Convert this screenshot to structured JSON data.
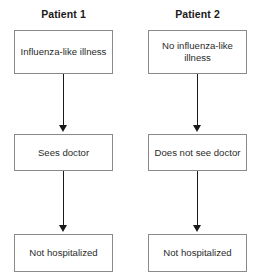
{
  "diagram": {
    "background_color": "#ffffff",
    "box_border_color": "#8a8a8a",
    "arrow_color": "#1a1a1a",
    "text_color": "#2b2b2b",
    "header_text_color": "#1a1a1a",
    "columns": [
      {
        "header": "Patient 1",
        "nodes": [
          {
            "label": "Influenza-like illness"
          },
          {
            "label": "Sees doctor"
          },
          {
            "label": "Not hospitalized"
          }
        ]
      },
      {
        "header": "Patient 2",
        "nodes": [
          {
            "label": "No influenza-like illness"
          },
          {
            "label": "Does not see doctor"
          },
          {
            "label": "Not hospitalized"
          }
        ]
      }
    ]
  }
}
